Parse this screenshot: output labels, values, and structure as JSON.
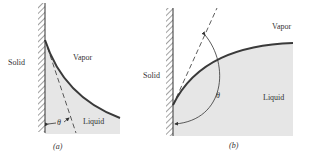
{
  "figure": {
    "panel_a": {
      "caption": "(a)",
      "labels": {
        "solid": "Solid",
        "vapor": "Vapor",
        "liquid": "Liquid",
        "angle": "θ"
      }
    },
    "panel_b": {
      "caption": "(b)",
      "labels": {
        "solid": "Solid",
        "vapor": "Vapor",
        "liquid": "Liquid",
        "angle": "θ"
      }
    },
    "colors": {
      "liquid_fill": "#e6e6e6",
      "interface": "#3a3a3a",
      "line": "#333333"
    }
  }
}
